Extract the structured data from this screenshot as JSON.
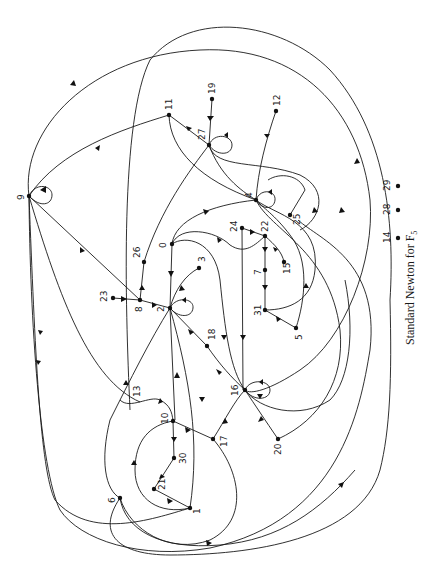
{
  "figure": {
    "caption": "Standard Newton for F",
    "caption_subscript": "5",
    "rotation_deg": -90,
    "colors": {
      "ink": "#1a1a1a",
      "background": "#ffffff"
    }
  },
  "graph": {
    "nodes": [
      {
        "id": "0",
        "label": "0",
        "x": 172,
        "y": 244
      },
      {
        "id": "1",
        "label": "1",
        "x": 190,
        "y": 508
      },
      {
        "id": "2",
        "label": "2",
        "x": 170,
        "y": 308
      },
      {
        "id": "3",
        "label": "3",
        "x": 199,
        "y": 268
      },
      {
        "id": "4",
        "label": "4",
        "x": 256,
        "y": 200
      },
      {
        "id": "5",
        "label": "5",
        "x": 296,
        "y": 328
      },
      {
        "id": "6",
        "label": "6",
        "x": 120,
        "y": 498
      },
      {
        "id": "7",
        "label": "7",
        "x": 265,
        "y": 270
      },
      {
        "id": "8",
        "label": "8",
        "x": 140,
        "y": 300
      },
      {
        "id": "9",
        "label": "9",
        "x": 29,
        "y": 196
      },
      {
        "id": "10",
        "label": "10",
        "x": 173,
        "y": 421
      },
      {
        "id": "11",
        "label": "11",
        "x": 169,
        "y": 115
      },
      {
        "id": "12",
        "label": "12",
        "x": 276,
        "y": 111
      },
      {
        "id": "13",
        "label": "13",
        "x": 140,
        "y": 402
      },
      {
        "id": "14",
        "label": "14",
        "x": 398,
        "y": 238
      },
      {
        "id": "15",
        "label": "15",
        "x": 284,
        "y": 262
      },
      {
        "id": "16",
        "label": "16",
        "x": 245,
        "y": 390
      },
      {
        "id": "17",
        "label": "17",
        "x": 213,
        "y": 439
      },
      {
        "id": "18",
        "label": "18",
        "x": 207,
        "y": 346
      },
      {
        "id": "19",
        "label": "19",
        "x": 212,
        "y": 99
      },
      {
        "id": "20",
        "label": "20",
        "x": 278,
        "y": 439
      },
      {
        "id": "21",
        "label": "21",
        "x": 154,
        "y": 489
      },
      {
        "id": "22",
        "label": "22",
        "x": 265,
        "y": 236
      },
      {
        "id": "23",
        "label": "23",
        "x": 113,
        "y": 298
      },
      {
        "id": "24",
        "label": "24",
        "x": 242,
        "y": 228
      },
      {
        "id": "25",
        "label": "25",
        "x": 290,
        "y": 215
      },
      {
        "id": "26",
        "label": "26",
        "x": 144,
        "y": 262
      },
      {
        "id": "27",
        "label": "27",
        "x": 209,
        "y": 145
      },
      {
        "id": "28",
        "label": "28",
        "x": 398,
        "y": 210
      },
      {
        "id": "29",
        "label": "29",
        "x": 398,
        "y": 186
      },
      {
        "id": "30",
        "label": "30",
        "x": 174,
        "y": 458
      },
      {
        "id": "31",
        "label": "31",
        "x": 265,
        "y": 310
      }
    ],
    "isolated_nodes": [
      "14",
      "28",
      "29"
    ],
    "self_loops": [
      "2",
      "4",
      "9",
      "16",
      "27"
    ],
    "edges": [
      {
        "from": "19",
        "to": "27"
      },
      {
        "from": "11",
        "to": "27"
      },
      {
        "from": "12",
        "to": "4"
      },
      {
        "from": "11",
        "to": "9"
      },
      {
        "from": "8",
        "to": "9"
      },
      {
        "from": "23",
        "to": "8"
      },
      {
        "from": "8",
        "to": "26"
      },
      {
        "from": "8",
        "to": "2"
      },
      {
        "from": "3",
        "to": "2"
      },
      {
        "from": "0",
        "to": "2"
      },
      {
        "from": "0",
        "to": "4"
      },
      {
        "from": "0",
        "to": "22"
      },
      {
        "from": "24",
        "to": "22"
      },
      {
        "from": "22",
        "to": "7"
      },
      {
        "from": "7",
        "to": "31"
      },
      {
        "from": "22",
        "to": "15"
      },
      {
        "from": "31",
        "to": "5"
      },
      {
        "from": "5",
        "to": "4"
      },
      {
        "from": "2",
        "to": "18"
      },
      {
        "from": "18",
        "to": "16"
      },
      {
        "from": "17",
        "to": "16"
      },
      {
        "from": "20",
        "to": "16"
      },
      {
        "from": "10",
        "to": "17"
      },
      {
        "from": "10",
        "to": "30"
      },
      {
        "from": "21",
        "to": "30"
      },
      {
        "from": "21",
        "to": "1"
      },
      {
        "from": "1",
        "to": "10"
      },
      {
        "from": "13",
        "to": "10"
      },
      {
        "from": "2",
        "to": "1"
      },
      {
        "from": "6",
        "to": "9"
      },
      {
        "from": "1",
        "to": "9"
      },
      {
        "from": "13",
        "to": "9"
      },
      {
        "from": "6",
        "to": "29"
      },
      {
        "from": "27",
        "to": "4"
      },
      {
        "from": "4",
        "to": "27"
      },
      {
        "from": "4",
        "to": "25"
      },
      {
        "from": "25",
        "to": "27"
      },
      {
        "from": "27",
        "to": "9"
      },
      {
        "from": "24",
        "to": "16"
      },
      {
        "from": "0",
        "to": "16"
      },
      {
        "from": "2",
        "to": "27"
      }
    ]
  }
}
